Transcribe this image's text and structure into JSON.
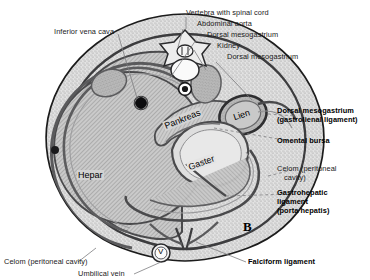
{
  "figure": {
    "marker": "B",
    "caption_title": "Transverse section of the abdomen showing mesogastria and celom"
  },
  "labels_top_left": [
    {
      "id": "inferior-vena-cava",
      "text": "Inferior vena cava",
      "bold": false
    }
  ],
  "labels_top_right": [
    {
      "id": "vertebra-with-spinal-cord",
      "text": "Vertebra with spinal cord",
      "bold": false
    },
    {
      "id": "abdominal-aorta",
      "text": "Abdominal aorta",
      "bold": false
    },
    {
      "id": "dorsal-mesogastrium-top",
      "text": "Dorsal mesogastrium",
      "bold": false
    },
    {
      "id": "kidney",
      "text": "Kidney",
      "bold": false
    },
    {
      "id": "dorsal-mesogastrium-second",
      "text": "Dorsal mesogastrium",
      "bold": false
    }
  ],
  "labels_right": [
    {
      "id": "dorsal-mesogastrium-gastrolienal",
      "line1": "Dorsal mesogastrium",
      "line2": "(gastrolienal ligament)",
      "bold": true
    },
    {
      "id": "omental-bursa",
      "line1": "Omental bursa",
      "line2": "",
      "bold": true
    },
    {
      "id": "celom-peritoneal-cavity-right",
      "line1": "Celom (peritoneal",
      "line2": "cavity)",
      "bold": false
    },
    {
      "id": "gastrohepatic-ligament",
      "line1": "Gastrohepatic",
      "line2": "ligament",
      "line3": "(porta hepatis)",
      "bold": true
    }
  ],
  "labels_bottom": [
    {
      "id": "celom-peritoneal-cavity-bottom",
      "text": "Celom (peritoneal cavity)",
      "bold": false
    },
    {
      "id": "umbilical-vein",
      "text": "Umbilical vein",
      "bold": false
    },
    {
      "id": "falciform-ligament",
      "text": "Falciform ligament",
      "bold": true
    }
  ],
  "organ_labels": [
    {
      "id": "hepar",
      "text": "Hepar"
    },
    {
      "id": "pankreas",
      "text": "Pankreas"
    },
    {
      "id": "gaster",
      "text": "Gaster"
    },
    {
      "id": "lien",
      "text": "Lien"
    },
    {
      "id": "umbilical-vein-glyph",
      "text": "V"
    }
  ],
  "colors": {
    "background": "#ffffff",
    "body_wall_fill": "#d8d8d8",
    "celom_stipple": "#cfcfcf",
    "liver_fill": "#c2c2c2",
    "organ_outline": "#58585a",
    "dark_outline": "#1a1a1a",
    "kidney_fill": "#b5b5b5",
    "leader_line": "#8a8a8a",
    "text": "#1a1a1a"
  }
}
